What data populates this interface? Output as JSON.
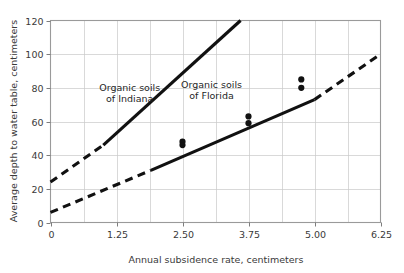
{
  "chart_data": {
    "type": "line",
    "title": "",
    "xlabel": "Annual subsidence rate, centimeters",
    "ylabel": "Average depth to water table, centimeters",
    "xlim": [
      0,
      6.25
    ],
    "ylim": [
      0,
      120
    ],
    "xticks": [
      "0",
      "1.25",
      "2.50",
      "3.75",
      "5.00",
      "6.25"
    ],
    "xtick_values": [
      0,
      1.25,
      2.5,
      3.75,
      5.0,
      6.25
    ],
    "yticks": [
      "0",
      "20",
      "40",
      "60",
      "80",
      "100",
      "120"
    ],
    "ytick_values": [
      0,
      20,
      40,
      60,
      80,
      100,
      120
    ],
    "grid": true,
    "grid_x_minor_step": 0.625,
    "grid_y_step": 20,
    "legend": "none",
    "series": [
      {
        "name": "Organic soils of Indiana",
        "annotation_line_1": "Organic soils",
        "annotation_line_2": "of Indiana",
        "annotation_x": 1.5,
        "annotation_y": 78,
        "color": "#111111",
        "x": [
          0,
          1.0,
          3.6
        ],
        "y": [
          24,
          46,
          120
        ],
        "solid_from_x": 1.0,
        "solid_to_x": 3.6,
        "dashed_segments": [
          [
            0,
            1.0
          ]
        ],
        "points": []
      },
      {
        "name": "Organic soils of Florida",
        "annotation_line_1": "Organic soils",
        "annotation_line_2": "of Florida",
        "annotation_x": 3.05,
        "annotation_y": 80,
        "color": "#111111",
        "x": [
          0,
          1.9,
          5.0,
          6.25
        ],
        "y": [
          6,
          31,
          73,
          100
        ],
        "solid_from_x": 1.9,
        "solid_to_x": 5.0,
        "dashed_segments": [
          [
            0,
            1.9
          ],
          [
            5.0,
            6.25
          ]
        ],
        "points": [
          {
            "x": 2.5,
            "y": 48
          },
          {
            "x": 2.5,
            "y": 46
          },
          {
            "x": 3.75,
            "y": 63
          },
          {
            "x": 3.75,
            "y": 59
          },
          {
            "x": 4.75,
            "y": 85
          },
          {
            "x": 4.75,
            "y": 80
          }
        ]
      }
    ]
  },
  "axes": {
    "x_title": "Annual subsidence rate, centimeters",
    "y_title": "Average depth to water table, centimeters"
  }
}
